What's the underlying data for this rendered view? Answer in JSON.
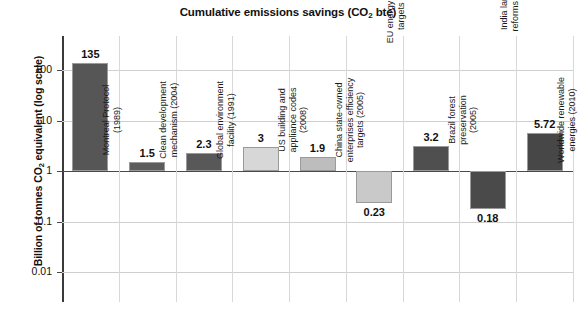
{
  "chart_data": {
    "type": "bar",
    "title": "Cumulative emissions savings (CO2 bte)",
    "title_main": "Cumulative emissions savings (CO",
    "title_sub": "2",
    "title_tail": " bte)",
    "xlabel": "",
    "ylabel": "Billion of tonnes CO2 equivalent (log scale)",
    "ylabel_main": "Billion of tonnes CO",
    "ylabel_sub": "2",
    "ylabel_tail": " equivalent (log scale)",
    "scale": "log",
    "ylim": [
      0.01,
      300
    ],
    "ytick_labels": [
      "100",
      "10",
      "1",
      "0.1",
      "0.01"
    ],
    "ytick_values": [
      100,
      10,
      1,
      0.1,
      0.01
    ],
    "grid": true,
    "legend": "none",
    "baseline_value": 1,
    "categories": [
      "Montreal Protocol\n(1989)",
      "Clean development\nmechanism (2004)",
      "Global environment\nfacility (1991)",
      "US building and\nappliance codes\n(2008)",
      "China state-owned\nenterprises efficiency\ntargets (2005)",
      "EU energy efficiency\ntargets (2008)",
      "Brazil forest\npreservation\n(2005)",
      "India land use\nreforms (2007)",
      "Worldwide renewable\nenergies (2010)"
    ],
    "values": [
      135,
      1.5,
      2.3,
      3,
      1.9,
      0.23,
      3.2,
      0.18,
      5.72
    ],
    "value_labels": [
      "135",
      "1.5",
      "2.3",
      "3",
      "1.9",
      "0.23",
      "3.2",
      "0.18",
      "5.72"
    ],
    "bar_colors": [
      "#565656",
      "#5c5c5c",
      "#585858",
      "#d7d7d7",
      "#bdbdbd",
      "#c9c9c9",
      "#4f4f4f",
      "#4a4a4a",
      "#474747"
    ]
  }
}
